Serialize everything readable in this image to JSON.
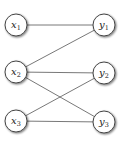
{
  "graph": {
    "type": "bipartite",
    "left_nodes": [
      {
        "id": "x1",
        "base": "x",
        "sub": "1",
        "cx": 16,
        "cy": 25
      },
      {
        "id": "x2",
        "base": "x",
        "sub": "2",
        "cx": 16,
        "cy": 72
      },
      {
        "id": "x3",
        "base": "x",
        "sub": "3",
        "cx": 16,
        "cy": 121
      }
    ],
    "right_nodes": [
      {
        "id": "y1",
        "base": "y",
        "sub": "1",
        "cx": 104,
        "cy": 25
      },
      {
        "id": "y2",
        "base": "y",
        "sub": "2",
        "cx": 104,
        "cy": 73
      },
      {
        "id": "y3",
        "base": "y",
        "sub": "3",
        "cx": 104,
        "cy": 122
      }
    ],
    "edges": [
      [
        "x1",
        "y1"
      ],
      [
        "x2",
        "y1"
      ],
      [
        "x2",
        "y2"
      ],
      [
        "x2",
        "y3"
      ],
      [
        "x3",
        "y2"
      ],
      [
        "x3",
        "y3"
      ]
    ],
    "node_radius": 11,
    "colors": {
      "edge": "#555555",
      "node_stroke": "#444444",
      "node_fill": "#ffffff"
    }
  }
}
